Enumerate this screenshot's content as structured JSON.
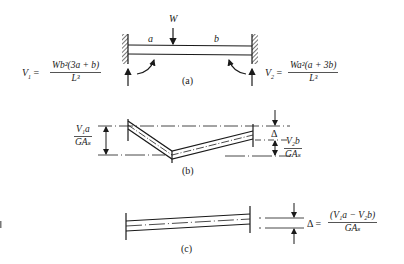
{
  "figure": {
    "panel_a": {
      "caption": "(a)",
      "load_label": "W",
      "segment_a_label": "a",
      "segment_b_label": "b",
      "left_reaction": {
        "lhs": "V",
        "lhs_sub": "1",
        "equals": "=",
        "numerator": "Wb²(3a + b)",
        "denominator": "L³"
      },
      "right_reaction": {
        "lhs": "V",
        "lhs_sub": "2",
        "equals": "=",
        "numerator": "Wa²(a + 3b)",
        "denominator": "L³"
      }
    },
    "panel_b": {
      "caption": "(b)",
      "left_dimension": {
        "numerator": "V₁a",
        "denominator": "GAₛ"
      },
      "delta_label": "Δ",
      "right_dimension": {
        "numerator": "V₂b",
        "denominator": "GAₛ"
      }
    },
    "panel_c": {
      "caption": "(c)",
      "delta_equation": {
        "lhs": "Δ",
        "equals": "=",
        "numerator": "(V₁a − V₂b)",
        "denominator": "GAₛ"
      }
    },
    "colors": {
      "line": "#1a1a1a",
      "background": "#ffffff"
    }
  }
}
